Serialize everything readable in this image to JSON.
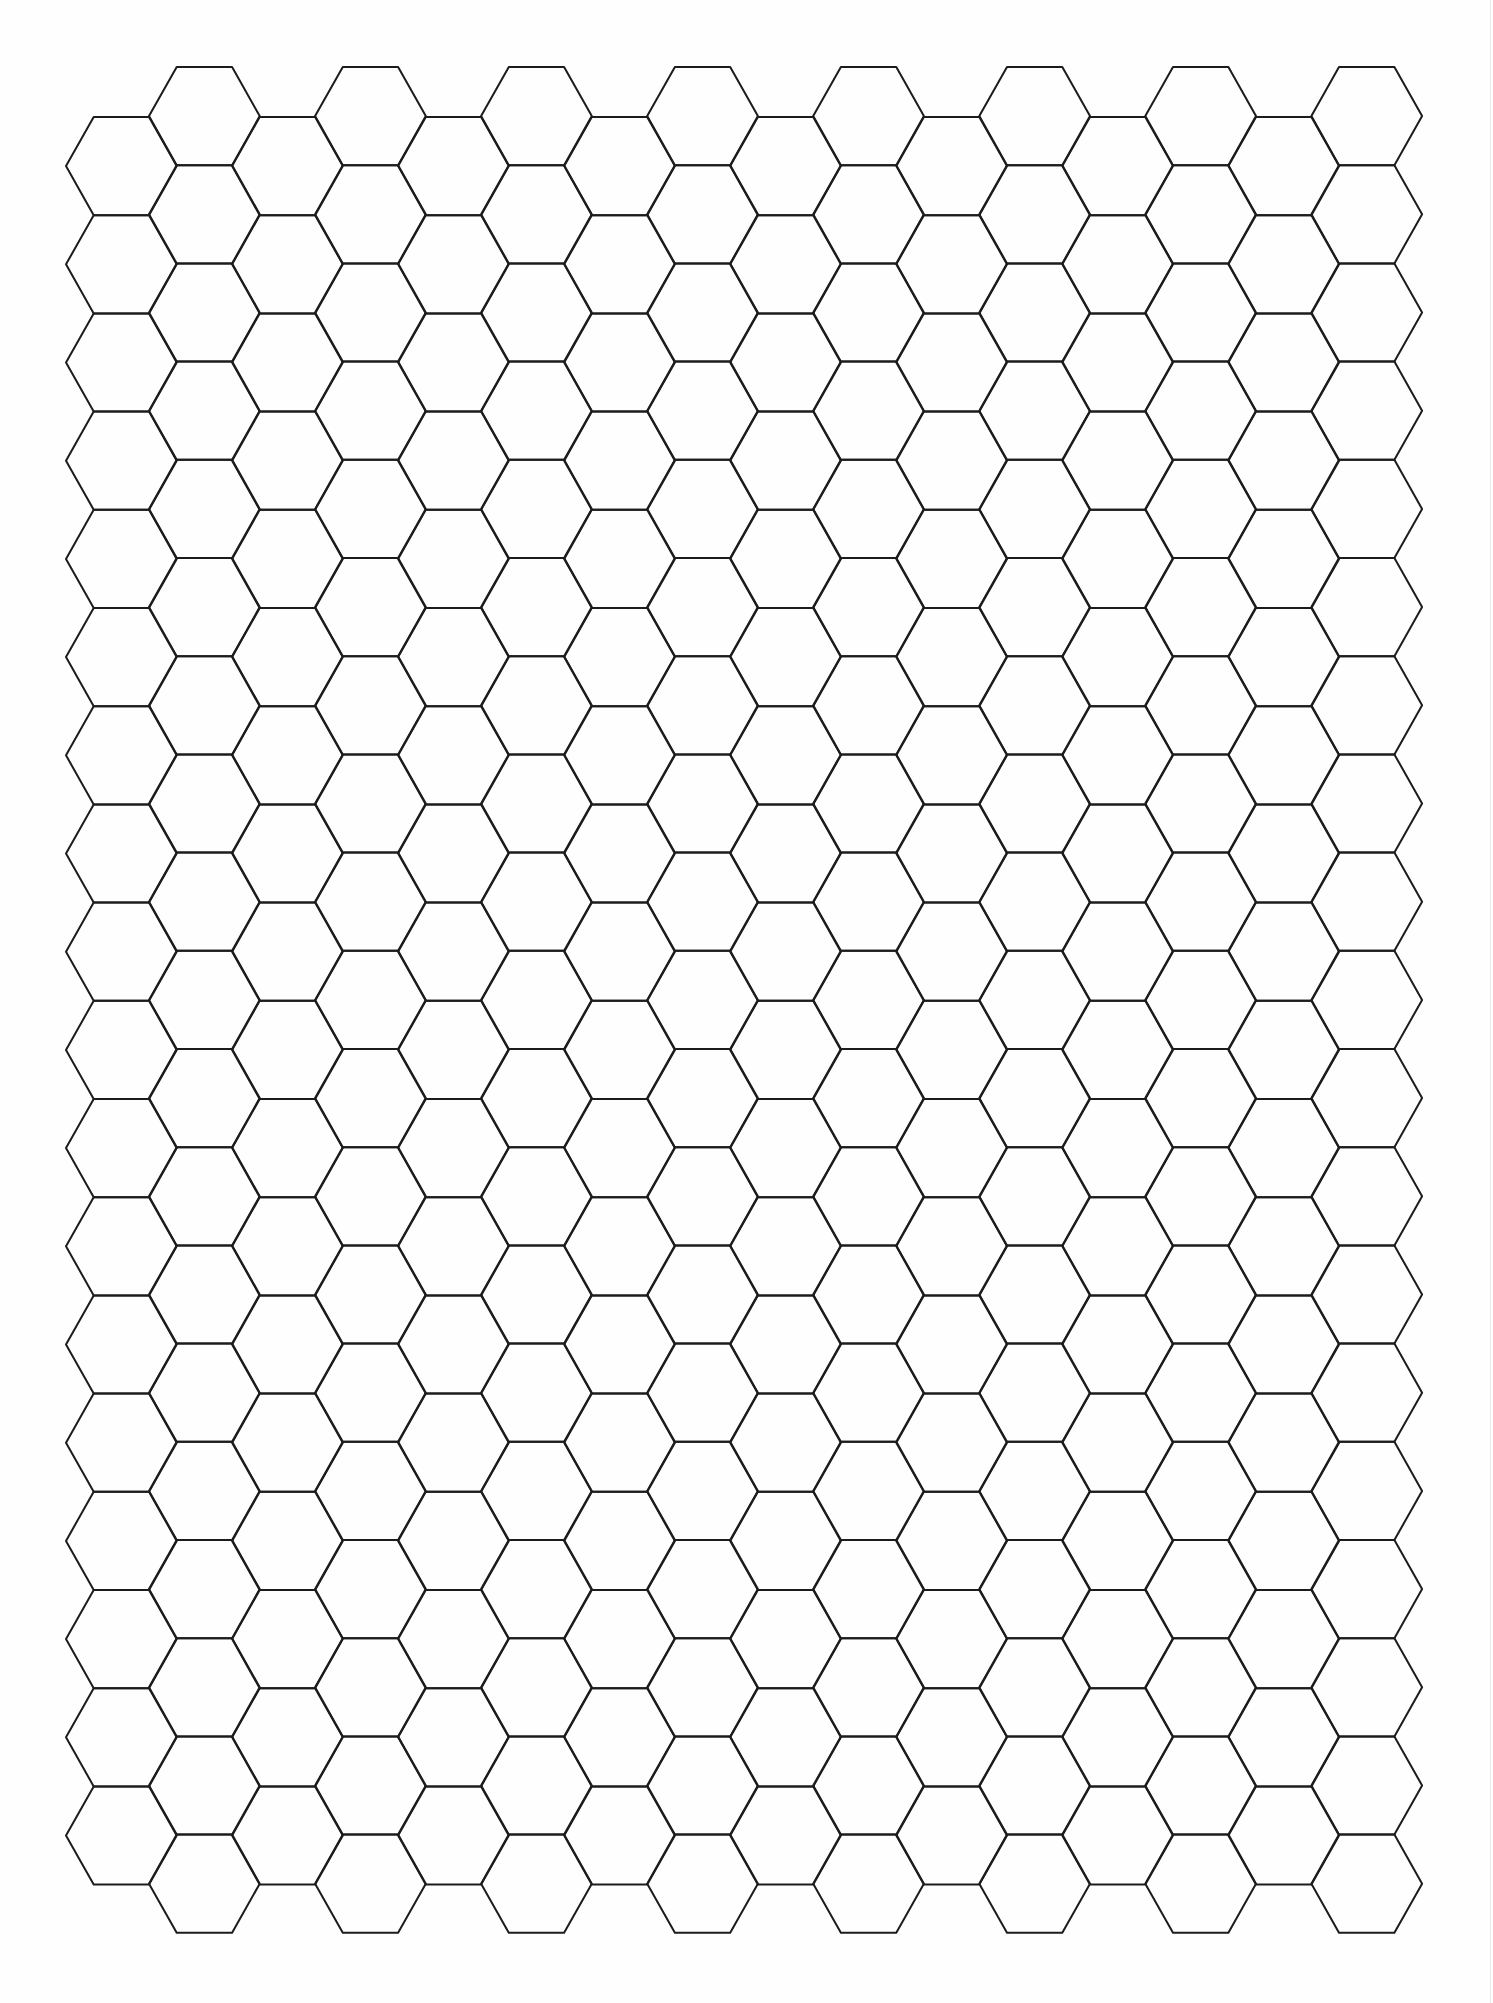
{
  "page": {
    "background": "#fefefe"
  },
  "hex_grid": {
    "orientation": "flat-top",
    "columns": 16,
    "rows_even_columns": 18,
    "rows_odd_columns": 19,
    "side_length_px": 55.35,
    "row_pitch_px": 98.2,
    "origin_left_vertex_x": 66,
    "even_column_top_y": 117,
    "odd_column_top_y": 67,
    "stroke_color": "#1c1c1c",
    "stroke_width_px": 2
  }
}
